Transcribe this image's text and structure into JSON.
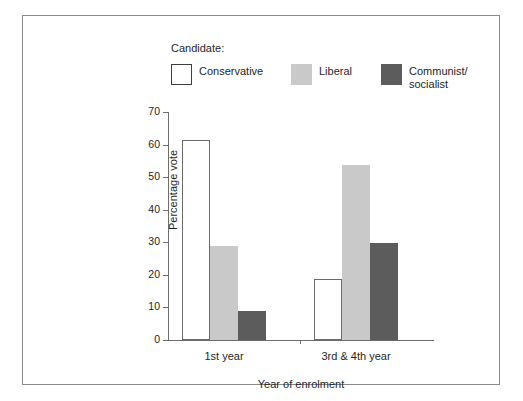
{
  "chart_data": {
    "type": "bar",
    "title": "",
    "subtitle": "",
    "xlabel": "Year of enrolment",
    "ylabel": "Percentage vote",
    "categories": [
      "1st year",
      "3rd & 4th year"
    ],
    "series": [
      {
        "name": "Conservative",
        "values": [
          61.5,
          18.8
        ],
        "color": "#ffffff"
      },
      {
        "name": "Liberal",
        "values": [
          28.8,
          53.7
        ],
        "color": "#c9c9c9"
      },
      {
        "name": "Communist/\nsocialist",
        "values": [
          9.0,
          29.8
        ],
        "color": "#5c5c5c"
      }
    ],
    "ylim": [
      0,
      70
    ],
    "yticks": [
      0,
      10,
      20,
      30,
      40,
      50,
      60,
      70
    ],
    "ytick_labels": [
      "0",
      "10",
      "20",
      "30",
      "40",
      "50",
      "60",
      "70"
    ],
    "grid": false,
    "legend_position": "top",
    "legend_title": "Candidate:"
  },
  "legend": {
    "title": "Candidate:",
    "entries": [
      {
        "label": "Conservative",
        "color": "#ffffff"
      },
      {
        "label": "Liberal",
        "color": "#c9c9c9"
      },
      {
        "label": "Communist/\nsocialist",
        "color": "#5c5c5c"
      }
    ]
  },
  "axes": {
    "y_title": "Percentage vote",
    "x_title": "Year of enrolment",
    "y_tick_labels": [
      "70",
      "60",
      "50",
      "40",
      "30",
      "20",
      "10",
      "0"
    ],
    "x_tick_labels": [
      "1st year",
      "3rd & 4th year"
    ]
  },
  "colors": {
    "frame": "#8a8a8a",
    "axis": "#6e6e6e",
    "text": "#1f1f1f",
    "conservative": "#ffffff",
    "liberal": "#c9c9c9",
    "communist": "#5c5c5c"
  }
}
